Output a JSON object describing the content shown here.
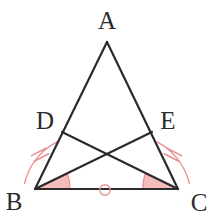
{
  "figure": {
    "width": 216,
    "height": 220,
    "background_color": "#ffffff",
    "line_color": "#2b2b2b",
    "mark_color": "#e8908f",
    "mark_fill_color": "#f3bcbb",
    "line_width": 2.2
  },
  "labels": {
    "a": "A",
    "b": "B",
    "c": "C",
    "d": "D",
    "e": "E"
  },
  "points": {
    "A": {
      "x": 107,
      "y": 42,
      "label": "A",
      "label_x": 107,
      "label_y": 20
    },
    "B": {
      "x": 35,
      "y": 189,
      "label": "B",
      "label_x": 14,
      "label_y": 201
    },
    "C": {
      "x": 178,
      "y": 189,
      "label": "C",
      "label_x": 199,
      "label_y": 202
    },
    "D": {
      "x": 62,
      "y": 132,
      "label": "D",
      "label_x": 45,
      "label_y": 120
    },
    "E": {
      "x": 152,
      "y": 132,
      "label": "E",
      "label_x": 168,
      "label_y": 120
    },
    "X": {
      "x": 107,
      "y": 157,
      "label": "",
      "label_x": 0,
      "label_y": 0
    }
  },
  "segments": [
    {
      "name": "side-AB",
      "from": "A",
      "to": "B",
      "color": "#2b2b2b"
    },
    {
      "name": "side-AC",
      "from": "A",
      "to": "C",
      "color": "#2b2b2b"
    },
    {
      "name": "side-BC",
      "from": "B",
      "to": "C",
      "color": "#2b2b2b"
    },
    {
      "name": "cevian-BE",
      "from": "B",
      "to": "E",
      "color": "#2b2b2b"
    },
    {
      "name": "cevian-CD",
      "from": "C",
      "to": "D",
      "color": "#2b2b2b"
    }
  ],
  "marks": {
    "angle_wedges": [
      {
        "name": "angle-mark-B",
        "vertex": "B",
        "color": "#e8908f",
        "fill": "#f3bcbb"
      },
      {
        "name": "angle-mark-C",
        "vertex": "C",
        "color": "#e8908f",
        "fill": "#f3bcbb"
      }
    ],
    "arcs": [
      {
        "name": "arc-B",
        "vertex": "B",
        "color": "#e8908f"
      },
      {
        "name": "arc-C",
        "vertex": "C",
        "color": "#e8908f"
      }
    ],
    "tick_marks": [
      {
        "name": "tick-BD",
        "segment": "BD",
        "count": 2,
        "color": "#e8908f"
      },
      {
        "name": "tick-CE",
        "segment": "CE",
        "count": 2,
        "color": "#e8908f"
      }
    ],
    "midpoint_ring": {
      "name": "midpoint-ring-BC",
      "segment": "BC",
      "cx": 105,
      "cy": 190,
      "r": 5.2,
      "color": "#e8908f"
    }
  }
}
